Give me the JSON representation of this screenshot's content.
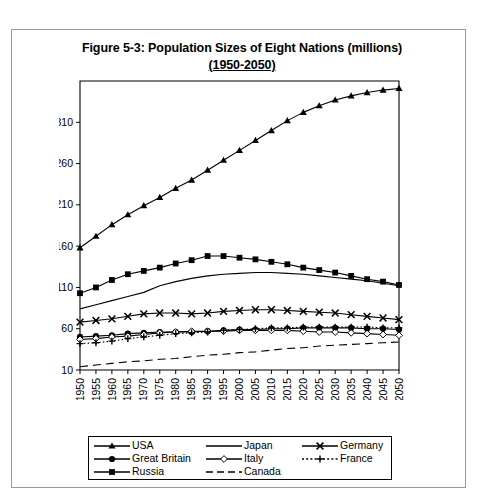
{
  "figure": {
    "title_line1": "Figure 5-3: Population Sizes of Eight Nations (millions)",
    "title_line2": "(1950-2050)"
  },
  "legend": {
    "entries": [
      {
        "label": "USA",
        "marker": "triangle",
        "style": "solid"
      },
      {
        "label": "Japan",
        "marker": "none",
        "style": "solid"
      },
      {
        "label": "Germany",
        "marker": "cross-x",
        "style": "solid"
      },
      {
        "label": "Great Britain",
        "marker": "circle-filled",
        "style": "solid"
      },
      {
        "label": "Italy",
        "marker": "diamond-open",
        "style": "solid"
      },
      {
        "label": "France",
        "marker": "plus",
        "style": "dash-dot"
      },
      {
        "label": "Russia",
        "marker": "square-filled",
        "style": "solid"
      },
      {
        "label": "Canada",
        "marker": "none",
        "style": "dashed"
      }
    ]
  },
  "chart_data": {
    "type": "line",
    "title": "Figure 5-3: Population Sizes of Eight Nations (millions) (1950-2050)",
    "xlabel": "",
    "ylabel": "",
    "xlim": [
      1950,
      2050
    ],
    "ylim": [
      10,
      360
    ],
    "grid": false,
    "legend_position": "bottom",
    "xticks": [
      1950,
      1955,
      1960,
      1965,
      1970,
      1975,
      1980,
      1985,
      1990,
      1995,
      2000,
      2005,
      2010,
      2015,
      2020,
      2025,
      2030,
      2035,
      2040,
      2045,
      2050
    ],
    "yticks": [
      10,
      60,
      110,
      160,
      210,
      260,
      310
    ],
    "x": [
      1950,
      1955,
      1960,
      1965,
      1970,
      1975,
      1980,
      1985,
      1990,
      1995,
      2000,
      2005,
      2010,
      2015,
      2020,
      2025,
      2030,
      2035,
      2040,
      2045,
      2050
    ],
    "series": [
      {
        "name": "USA",
        "marker": "triangle",
        "style": "solid",
        "values": [
          158,
          172,
          186,
          198,
          209,
          219,
          230,
          240,
          252,
          264,
          276,
          288,
          300,
          312,
          322,
          330,
          337,
          342,
          346,
          349,
          351
        ]
      },
      {
        "name": "Japan",
        "marker": "none",
        "style": "solid",
        "values": [
          84,
          89,
          94,
          99,
          104,
          112,
          117,
          121,
          124,
          126,
          127,
          128,
          128,
          127,
          126,
          124,
          122,
          120,
          118,
          115,
          112
        ]
      },
      {
        "name": "Germany",
        "marker": "cross-x",
        "style": "solid",
        "values": [
          68,
          70,
          72,
          75,
          78,
          79,
          79,
          78,
          79,
          81,
          82,
          83,
          83,
          82,
          81,
          80,
          79,
          77,
          75,
          73,
          71
        ]
      },
      {
        "name": "Great Britain",
        "marker": "circle-filled",
        "style": "solid",
        "values": [
          50,
          51,
          52,
          54,
          55,
          56,
          56,
          56,
          57,
          58,
          59,
          59,
          60,
          60,
          61,
          61,
          61,
          61,
          60,
          60,
          59
        ]
      },
      {
        "name": "Italy",
        "marker": "diamond-open",
        "style": "solid",
        "values": [
          47,
          48,
          50,
          51,
          53,
          55,
          56,
          57,
          57,
          57,
          58,
          58,
          58,
          58,
          57,
          56,
          56,
          55,
          54,
          53,
          52
        ]
      },
      {
        "name": "France",
        "marker": "plus",
        "style": "dash-dot",
        "values": [
          42,
          43,
          45,
          48,
          50,
          52,
          54,
          55,
          56,
          58,
          59,
          60,
          61,
          61,
          62,
          62,
          62,
          62,
          62,
          61,
          61
        ]
      },
      {
        "name": "Russia",
        "marker": "square-filled",
        "style": "solid",
        "values": [
          103,
          110,
          119,
          126,
          130,
          134,
          139,
          143,
          148,
          148,
          146,
          144,
          141,
          138,
          134,
          131,
          128,
          124,
          120,
          117,
          113
        ]
      },
      {
        "name": "Canada",
        "marker": "none",
        "style": "dashed",
        "values": [
          14,
          16,
          18,
          20,
          21,
          23,
          24,
          26,
          28,
          29,
          31,
          32,
          34,
          36,
          37,
          39,
          40,
          41,
          42,
          43,
          44
        ]
      }
    ]
  }
}
